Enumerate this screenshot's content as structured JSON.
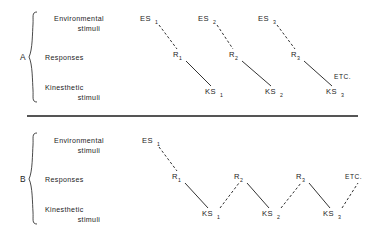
{
  "figure": {
    "ink_color": "#1c1c1c",
    "background_color": "#ffffff"
  },
  "row_labels": {
    "environmental_line1": "Environmental",
    "environmental_line2": "stimuli",
    "responses": "Responses",
    "kinesthetic_line1": "Kinesthetic",
    "kinesthetic_line2": "stimuli"
  },
  "panels": [
    {
      "id": "A",
      "letter": "A",
      "description": "Separate chains: each environmental stimulus leads by dashed link to a response, which leads by solid link to a kinesthetic stimulus; chains are not connected to each other.",
      "nodes": [
        {
          "name": "es1",
          "base": "ES",
          "sub": "1",
          "row": "environmental",
          "x": 150,
          "y": 21
        },
        {
          "name": "es2",
          "base": "ES",
          "sub": "2",
          "row": "environmental",
          "x": 208,
          "y": 21
        },
        {
          "name": "es3",
          "base": "ES",
          "sub": "3",
          "row": "environmental",
          "x": 268,
          "y": 21
        },
        {
          "name": "r1",
          "base": "R",
          "sub": "1",
          "row": "responses",
          "x": 178,
          "y": 57
        },
        {
          "name": "r2",
          "base": "R",
          "sub": "2",
          "row": "responses",
          "x": 234,
          "y": 57
        },
        {
          "name": "r3",
          "base": "R",
          "sub": "3",
          "row": "responses",
          "x": 296,
          "y": 57
        },
        {
          "name": "ks1",
          "base": "KS",
          "sub": "1",
          "row": "kinesthetic",
          "x": 215,
          "y": 94
        },
        {
          "name": "ks2",
          "base": "KS",
          "sub": "2",
          "row": "kinesthetic",
          "x": 275,
          "y": 94
        },
        {
          "name": "ks3",
          "base": "KS",
          "sub": "3",
          "row": "kinesthetic",
          "x": 337,
          "y": 94
        }
      ],
      "links": [
        {
          "from": "es1",
          "to": "r1",
          "style": "dashed"
        },
        {
          "from": "es2",
          "to": "r2",
          "style": "dashed"
        },
        {
          "from": "es3",
          "to": "r3",
          "style": "dashed"
        },
        {
          "from": "r1",
          "to": "ks1",
          "style": "solid"
        },
        {
          "from": "r2",
          "to": "ks2",
          "style": "solid"
        },
        {
          "from": "r3",
          "to": "ks3",
          "style": "solid"
        }
      ],
      "etc": {
        "label": "ETC.",
        "x": 344,
        "y": 79
      }
    },
    {
      "id": "B",
      "letter": "B",
      "description": "Continuous zigzag chain: one environmental stimulus begins the chain, then responses and kinesthetic stimuli alternate, kinesthetic stimuli feeding the next response.",
      "nodes": [
        {
          "name": "es1",
          "base": "ES",
          "sub": "1",
          "row": "environmental",
          "x": 152,
          "y": 143
        },
        {
          "name": "r1",
          "base": "R",
          "sub": "1",
          "row": "responses",
          "x": 178,
          "y": 179
        },
        {
          "name": "r2",
          "base": "R",
          "sub": "2",
          "row": "responses",
          "x": 240,
          "y": 179
        },
        {
          "name": "r3",
          "base": "R",
          "sub": "3",
          "row": "responses",
          "x": 302,
          "y": 179
        },
        {
          "name": "ks1",
          "base": "KS",
          "sub": "1",
          "row": "kinesthetic",
          "x": 212,
          "y": 216
        },
        {
          "name": "ks2",
          "base": "KS",
          "sub": "2",
          "row": "kinesthetic",
          "x": 272,
          "y": 216
        },
        {
          "name": "ks3",
          "base": "KS",
          "sub": "3",
          "row": "kinesthetic",
          "x": 333,
          "y": 216
        }
      ],
      "links": [
        {
          "from": "es1",
          "to": "r1",
          "style": "dashed"
        },
        {
          "from": "r1",
          "to": "ks1",
          "style": "solid"
        },
        {
          "from": "ks1",
          "to": "r2",
          "style": "dashed"
        },
        {
          "from": "r2",
          "to": "ks2",
          "style": "solid"
        },
        {
          "from": "ks2",
          "to": "r3",
          "style": "dashed"
        },
        {
          "from": "r3",
          "to": "ks3",
          "style": "solid"
        },
        {
          "from": "ks3",
          "to": "etc",
          "style": "dashed"
        }
      ],
      "etc": {
        "label": "ETC.",
        "x": 356,
        "y": 179
      }
    }
  ]
}
